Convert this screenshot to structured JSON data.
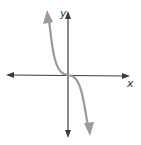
{
  "diagram": {
    "type": "function-graph",
    "axes": {
      "x_label": "x",
      "y_label": "y",
      "color": "#3a3a3a"
    },
    "curve": {
      "shape": "cubic-decreasing",
      "description": "Curve falls from upper-left, flattens through the origin, and continues down to lower-right (like y = -x^3)",
      "color": "#9a9a9a",
      "end_behavior": {
        "left": "rises (arrow up)",
        "right": "falls (arrow down)"
      }
    }
  }
}
